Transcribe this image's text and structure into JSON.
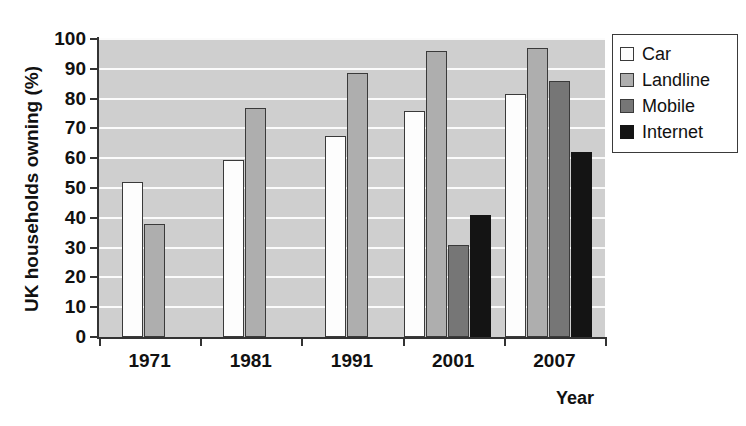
{
  "chart_data": {
    "type": "bar",
    "title": "",
    "xlabel": "Year",
    "ylabel": "UK households owning (%)",
    "categories": [
      "1971",
      "1981",
      "1991",
      "2001",
      "2007"
    ],
    "series": [
      {
        "name": "Car",
        "color": "#fdfdfd",
        "values": [
          52,
          59.5,
          67.5,
          76,
          81.5
        ]
      },
      {
        "name": "Landline",
        "color": "#aeaeae",
        "values": [
          38,
          77,
          88.5,
          96,
          97
        ]
      },
      {
        "name": "Mobile",
        "color": "#767676",
        "values": [
          null,
          null,
          null,
          31,
          86
        ]
      },
      {
        "name": "Internet",
        "color": "#141414",
        "values": [
          null,
          null,
          null,
          41,
          62
        ]
      }
    ],
    "ylim": [
      0,
      100
    ],
    "yticks": [
      "0",
      "10",
      "20",
      "30",
      "40",
      "50",
      "60",
      "70",
      "80",
      "90",
      "100"
    ],
    "grid": true,
    "legend_position": "right-top",
    "plot_background": "#cfcfcf",
    "gridline_color": "#fbfbfb"
  },
  "axes": {
    "y_title": "UK households owning (%)",
    "x_title": "Year"
  },
  "legend": {
    "items": [
      {
        "label": "Car"
      },
      {
        "label": "Landline"
      },
      {
        "label": "Mobile"
      },
      {
        "label": "Internet"
      }
    ]
  }
}
